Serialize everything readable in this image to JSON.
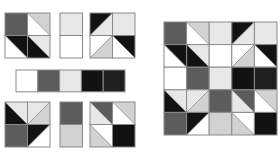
{
  "palette": {
    "W": "#ffffff",
    "L": "#e8e8e8",
    "G": "#d2d2d2",
    "D": "#5c5c5c",
    "K": "#121212",
    "X": "#1f1f1f"
  },
  "stroke": "#8a8a8a",
  "units": [
    {
      "name": "unit-top-left",
      "x": 5,
      "y": 13,
      "cell": 22.5,
      "cols": 2,
      "rows": 2,
      "cells": [
        {
          "fill": "D"
        },
        {
          "diag": "TLBR",
          "a": "G",
          "b": "W"
        },
        {
          "diag": "TLBR",
          "a": "K",
          "b": "W"
        },
        {
          "diag": "TLBR",
          "a": "L",
          "b": "K"
        }
      ]
    },
    {
      "name": "unit-top-middle",
      "x": 60,
      "y": 13,
      "cell": 22.5,
      "cols": 1,
      "rows": 2,
      "cells": [
        {
          "fill": "L"
        },
        {
          "fill": "W"
        }
      ]
    },
    {
      "name": "unit-top-right",
      "x": 90,
      "y": 13,
      "cell": 22.5,
      "cols": 2,
      "rows": 2,
      "cells": [
        {
          "diag": "TRBL",
          "a": "K",
          "b": "L"
        },
        {
          "fill": "L"
        },
        {
          "diag": "TRBL",
          "a": "W",
          "b": "G"
        },
        {
          "diag": "TLBR",
          "a": "K",
          "b": "W"
        }
      ]
    },
    {
      "name": "color-swatch-strip",
      "x": 16,
      "y": 70,
      "cell": 21.8,
      "cols": 5,
      "rows": 1,
      "cells": [
        {
          "fill": "W"
        },
        {
          "fill": "D"
        },
        {
          "fill": "L"
        },
        {
          "fill": "K"
        },
        {
          "fill": "X"
        }
      ]
    },
    {
      "name": "unit-bottom-left",
      "x": 5,
      "y": 102,
      "cell": 22.5,
      "cols": 2,
      "rows": 2,
      "cells": [
        {
          "diag": "TLBR",
          "a": "L",
          "b": "K"
        },
        {
          "diag": "TRBL",
          "a": "L",
          "b": "G"
        },
        {
          "fill": "D"
        },
        {
          "diag": "TRBL",
          "a": "K",
          "b": "W"
        }
      ]
    },
    {
      "name": "unit-bottom-middle",
      "x": 60,
      "y": 102,
      "cell": 22.5,
      "cols": 1,
      "rows": 2,
      "cells": [
        {
          "fill": "D"
        },
        {
          "fill": "G"
        }
      ]
    },
    {
      "name": "unit-bottom-right",
      "x": 90,
      "y": 102,
      "cell": 22.5,
      "cols": 2,
      "rows": 2,
      "cells": [
        {
          "diag": "TLBR",
          "a": "D",
          "b": "L"
        },
        {
          "diag": "TLBR",
          "a": "G",
          "b": "W"
        },
        {
          "diag": "TLBR",
          "a": "W",
          "b": "G"
        },
        {
          "fill": "K"
        }
      ]
    },
    {
      "name": "finished-block-5x5",
      "x": 164,
      "y": 22,
      "cell": 22.6,
      "cols": 5,
      "rows": 5,
      "cells": [
        {
          "fill": "D"
        },
        {
          "diag": "TLBR",
          "a": "G",
          "b": "W"
        },
        {
          "fill": "L"
        },
        {
          "diag": "TRBL",
          "a": "K",
          "b": "L"
        },
        {
          "fill": "L"
        },
        {
          "diag": "TLBR",
          "a": "K",
          "b": "W"
        },
        {
          "diag": "TLBR",
          "a": "L",
          "b": "K"
        },
        {
          "fill": "W"
        },
        {
          "diag": "TRBL",
          "a": "W",
          "b": "G"
        },
        {
          "diag": "TLBR",
          "a": "K",
          "b": "W"
        },
        {
          "fill": "W"
        },
        {
          "fill": "D"
        },
        {
          "fill": "L"
        },
        {
          "fill": "K"
        },
        {
          "fill": "X"
        },
        {
          "diag": "TLBR",
          "a": "L",
          "b": "K"
        },
        {
          "diag": "TRBL",
          "a": "L",
          "b": "G"
        },
        {
          "fill": "D"
        },
        {
          "diag": "TLBR",
          "a": "D",
          "b": "L"
        },
        {
          "diag": "TLBR",
          "a": "G",
          "b": "W"
        },
        {
          "fill": "D"
        },
        {
          "diag": "TRBL",
          "a": "K",
          "b": "W"
        },
        {
          "fill": "G"
        },
        {
          "diag": "TLBR",
          "a": "W",
          "b": "G"
        },
        {
          "fill": "K"
        }
      ]
    }
  ]
}
